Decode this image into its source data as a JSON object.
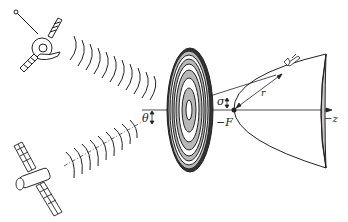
{
  "diagram": {
    "labels": {
      "theta": "θ",
      "sigma": "σ",
      "focus": "−F",
      "radius": "r",
      "axis": "−z"
    },
    "components": [
      {
        "name": "upper-satellite",
        "type": "satellite with dish and antenna"
      },
      {
        "name": "lower-satellite",
        "type": "satellite with solar panels"
      },
      {
        "name": "zone-plate",
        "type": "Fresnel zone plate with concentric rings"
      },
      {
        "name": "paraboloid",
        "type": "parabolic surface"
      },
      {
        "name": "spacecraft",
        "type": "shuttle on trajectory"
      }
    ],
    "colors": {
      "line": "#222222",
      "ring_fill": "#b8b8b8",
      "paraboloid_rim": "#c8c8c8"
    }
  }
}
